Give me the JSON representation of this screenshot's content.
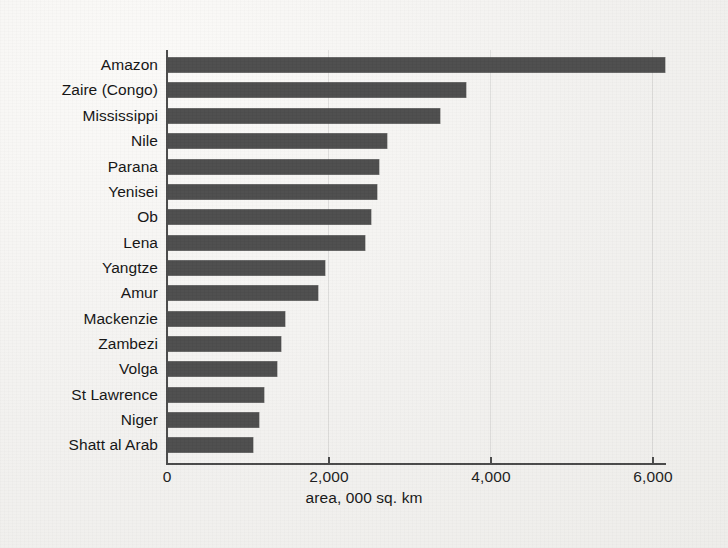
{
  "chart_data": {
    "type": "bar",
    "orientation": "horizontal",
    "title": "",
    "xlabel": "area, 000 sq. km",
    "ylabel": "",
    "xlim": [
      0,
      6170
    ],
    "xticks": [
      0,
      2000,
      4000,
      6000
    ],
    "xtick_labels": [
      "0",
      "2,000",
      "4,000",
      "6,000"
    ],
    "grid": false,
    "legend": null,
    "bar_color": "#4d4d4d",
    "axis_color": "#4a4a4a",
    "background_color": "#f3f2f0",
    "categories": [
      "Amazon",
      "Zaire (Congo)",
      "Mississippi",
      "Nile",
      "Parana",
      "Yenisei",
      "Ob",
      "Lena",
      "Yangtze",
      "Amur",
      "Mackenzie",
      "Zambezi",
      "Volga",
      "St Lawrence",
      "Niger",
      "Shatt al Arab"
    ],
    "values": [
      6140,
      3680,
      3360,
      2700,
      2600,
      2580,
      2500,
      2430,
      1940,
      1850,
      1450,
      1390,
      1350,
      1180,
      1120,
      1050
    ]
  }
}
